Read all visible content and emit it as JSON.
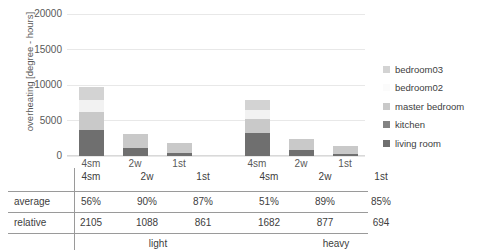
{
  "chart_data": {
    "type": "bar",
    "stacked": true,
    "title": "",
    "xlabel": "",
    "ylabel": "overheating [degree - hours]",
    "ylim": [
      0,
      20000
    ],
    "ytick_labels": [
      "0",
      "5000",
      "10000",
      "15000",
      "20000"
    ],
    "ytick_values": [
      0,
      5000,
      10000,
      15000,
      20000
    ],
    "grid": true,
    "legend_position": "right",
    "categories": [
      "4sm",
      "2w",
      "1st",
      "4sm",
      "2w",
      "1st"
    ],
    "groups": [
      {
        "name": "light",
        "categories": [
          "4sm",
          "2w",
          "1st"
        ]
      },
      {
        "name": "heavy",
        "categories": [
          "4sm",
          "2w",
          "1st"
        ]
      }
    ],
    "series": [
      {
        "name": "living room",
        "color": "#6f6f6f",
        "values": [
          3650,
          1180,
          480,
          3180,
          900,
          330
        ]
      },
      {
        "name": "kitchen",
        "color": "#7d7d7d",
        "values": [
          0,
          0,
          0,
          0,
          0,
          0
        ]
      },
      {
        "name": "master bedroom",
        "color": "#c9c9c9",
        "values": [
          2500,
          1920,
          1300,
          2050,
          1550,
          1080
        ]
      },
      {
        "name": "bedroom02",
        "color": "#f2f2f2",
        "values": [
          1700,
          0,
          0,
          1250,
          0,
          0
        ]
      },
      {
        "name": "bedroom03",
        "color": "#d3d3d3",
        "values": [
          1800,
          0,
          0,
          1450,
          0,
          0
        ]
      }
    ],
    "bar_totals": [
      9650,
      3100,
      1780,
      7930,
      2450,
      1410
    ]
  },
  "axis": {
    "y_title": "overheating [degree - hours]",
    "y_ticks": [
      "20000",
      "15000",
      "10000",
      "5000",
      "0"
    ]
  },
  "legend": {
    "items": [
      {
        "label": "bedroom03",
        "color": "#d3d3d3"
      },
      {
        "label": "bedroom02",
        "color": "#fbfbfb"
      },
      {
        "label": "master bedroom",
        "color": "#c9c9c9"
      },
      {
        "label": "kitchen",
        "color": "#838383"
      },
      {
        "label": "living room",
        "color": "#6f6f6f"
      }
    ]
  },
  "xaxis": {
    "labels": [
      "4sm",
      "2w",
      "1st",
      "4sm",
      "2w",
      "1st"
    ]
  },
  "table": {
    "row_labels": [
      "average",
      "relative"
    ],
    "header": [
      "4sm",
      "2w",
      "1st",
      "4sm",
      "2w",
      "1st"
    ],
    "average": [
      "56%",
      "90%",
      "87%",
      "51%",
      "89%",
      "85%"
    ],
    "relative": [
      "2105",
      "1088",
      "861",
      "1682",
      "877",
      "694"
    ],
    "groups": [
      "light",
      "heavy"
    ]
  }
}
